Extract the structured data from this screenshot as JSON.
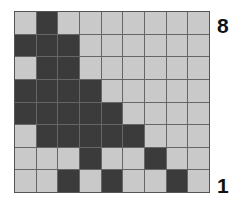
{
  "board": {
    "columns": 9,
    "rows": 8,
    "colors": {
      "empty": "#c9c9c9",
      "filled": "#3b3b3b",
      "grid_line": "#666666"
    },
    "cells": [
      [
        0,
        1,
        0,
        0,
        0,
        0,
        0,
        0,
        0
      ],
      [
        1,
        1,
        1,
        0,
        0,
        0,
        0,
        0,
        0
      ],
      [
        0,
        1,
        1,
        0,
        0,
        0,
        0,
        0,
        0
      ],
      [
        1,
        1,
        1,
        1,
        0,
        0,
        0,
        0,
        0
      ],
      [
        1,
        1,
        1,
        1,
        1,
        0,
        0,
        0,
        0
      ],
      [
        0,
        1,
        1,
        1,
        1,
        1,
        0,
        0,
        0
      ],
      [
        0,
        0,
        0,
        1,
        0,
        0,
        1,
        0,
        0
      ],
      [
        0,
        0,
        1,
        0,
        1,
        0,
        0,
        1,
        0
      ]
    ]
  },
  "labels": {
    "top_row": "8",
    "bottom_row": "1"
  }
}
